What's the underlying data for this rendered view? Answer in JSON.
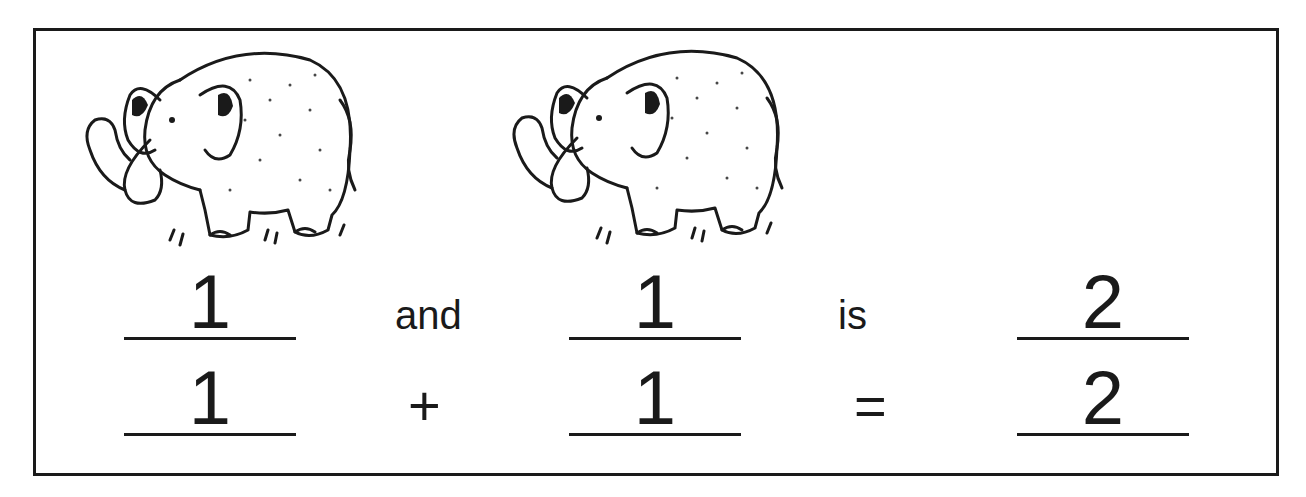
{
  "worksheet": {
    "pictures": [
      {
        "subject": "elephant",
        "count": 1
      },
      {
        "subject": "elephant",
        "count": 1
      }
    ],
    "word_sentence": {
      "addend1": "1",
      "connector": "and",
      "addend2": "1",
      "verb": "is",
      "total": "2"
    },
    "number_sentence": {
      "addend1": "1",
      "operator": "+",
      "addend2": "1",
      "equals": "=",
      "total": "2"
    },
    "colors": {
      "ink": "#1a1a1a",
      "paper": "#ffffff"
    }
  }
}
